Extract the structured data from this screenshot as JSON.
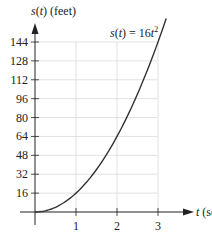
{
  "chart_data": {
    "type": "line",
    "title": "",
    "equation_label": "s(t) = 16t²",
    "xlabel": "t (sec)",
    "ylabel": "s(t) (feet)",
    "x_ticks": [
      1,
      2,
      3
    ],
    "y_ticks": [
      16,
      32,
      48,
      64,
      80,
      96,
      112,
      128,
      144
    ],
    "xlim": [
      0,
      3.1
    ],
    "ylim": [
      0,
      155
    ],
    "grid": true,
    "series": [
      {
        "name": "s(t) = 16t^2",
        "x": [
          0,
          0.5,
          1,
          1.5,
          2,
          2.5,
          3
        ],
        "y": [
          0,
          4,
          16,
          36,
          64,
          100,
          144
        ]
      }
    ],
    "colors": {
      "curve": "#333333",
      "grid": "#d9d9d9",
      "axis": "#222222"
    }
  },
  "labels": {
    "y_axis_s": "s",
    "y_axis_t": "t",
    "y_axis_rest": " (feet)",
    "x_axis_t": "t",
    "x_axis_rest": " (sec)",
    "eq_s": "s",
    "eq_t": "t",
    "eq_mid": " = 16",
    "eq_exp": "2",
    "x_tick_labels": [
      "1",
      "2",
      "3"
    ],
    "y_tick_labels": [
      "16",
      "32",
      "48",
      "64",
      "80",
      "96",
      "112",
      "128",
      "144"
    ]
  }
}
